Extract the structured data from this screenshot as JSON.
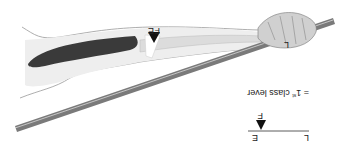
{
  "diagram": {
    "orientation": "rotated 180 degrees",
    "arm_labels": {
      "effort": "E",
      "fulcrum": "F",
      "load": "L"
    },
    "legend": {
      "effort": "E",
      "fulcrum": "F",
      "load": "L",
      "caption_prefix": "= 1",
      "caption_sup": "st",
      "caption_suffix": " class lever"
    },
    "colors": {
      "muscle": "#3a3a3a",
      "bone": "#e6e6e6",
      "skin_outline": "#888888",
      "rod": "#7a7a7a",
      "rod_highlight": "#d8d8d8",
      "fulcrum": "#111111"
    }
  }
}
